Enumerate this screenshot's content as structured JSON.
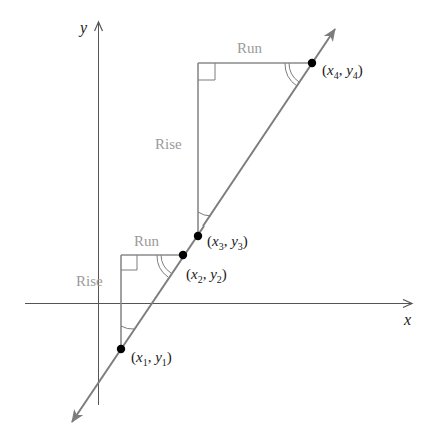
{
  "figure": {
    "axes": {
      "x_label": "x",
      "y_label": "y"
    },
    "triangles": [
      {
        "id": "lower",
        "run_label": "Run",
        "rise_label": "Rise"
      },
      {
        "id": "upper",
        "run_label": "Run",
        "rise_label": "Rise"
      }
    ],
    "points": [
      {
        "id": "p1",
        "x_var": "x",
        "x_sub": "1",
        "y_var": "y",
        "y_sub": "1"
      },
      {
        "id": "p2",
        "x_var": "x",
        "x_sub": "2",
        "y_var": "y",
        "y_sub": "2"
      },
      {
        "id": "p3",
        "x_var": "x",
        "x_sub": "3",
        "y_var": "y",
        "y_sub": "3"
      },
      {
        "id": "p4",
        "x_var": "x",
        "x_sub": "4",
        "y_var": "y",
        "y_sub": "4"
      }
    ],
    "punct": {
      "open": "(",
      "comma": ", ",
      "close": ")"
    },
    "colors": {
      "line": "#7d7d7d",
      "triangle": "#8a8a8a",
      "axis": "#555555",
      "label_gray": "#9a9a9a",
      "point": "#000000"
    }
  }
}
